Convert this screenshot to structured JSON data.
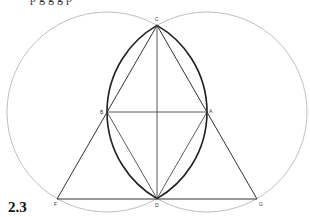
{
  "caption_fragment": "p g g g p",
  "figure": {
    "number": "2.3",
    "points": {
      "A": {
        "label": "A",
        "x": 207,
        "y": 112
      },
      "B": {
        "label": "B",
        "x": 107,
        "y": 112
      },
      "C": {
        "label": "C",
        "x": 157,
        "y": 25.4
      },
      "D": {
        "label": "D",
        "x": 157,
        "y": 198.6
      },
      "F": {
        "label": "F",
        "x": 57,
        "y": 199
      },
      "G": {
        "label": "G",
        "x": 257,
        "y": 199
      }
    },
    "circles": [
      {
        "center": "B",
        "radius": 100
      },
      {
        "center": "A",
        "radius": 100
      }
    ],
    "segments": [
      [
        "B",
        "A"
      ],
      [
        "C",
        "D"
      ],
      [
        "C",
        "F"
      ],
      [
        "C",
        "G"
      ],
      [
        "F",
        "G"
      ],
      [
        "B",
        "D"
      ],
      [
        "A",
        "D"
      ]
    ],
    "colors": {
      "circle": "#b0b0b0",
      "line": "#333333",
      "lens": "#222222"
    }
  }
}
